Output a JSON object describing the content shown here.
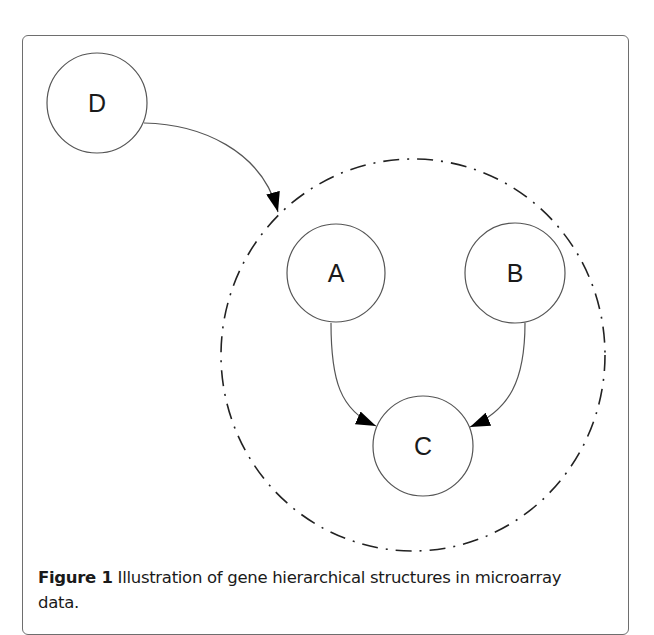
{
  "figure": {
    "number_label": "Figure 1",
    "caption_text": " Illustration of gene hierarchical structures in microarray data."
  },
  "diagram": {
    "nodes": [
      {
        "id": "D",
        "label": "D",
        "cx": 97,
        "cy": 103,
        "r": 50
      },
      {
        "id": "A",
        "label": "A",
        "cx": 336,
        "cy": 273,
        "r": 49
      },
      {
        "id": "B",
        "label": "B",
        "cx": 515,
        "cy": 273,
        "r": 50
      },
      {
        "id": "C",
        "label": "C",
        "cx": 423,
        "cy": 446,
        "r": 50
      }
    ],
    "group": {
      "label": "",
      "cx": 413,
      "cy": 355,
      "rx": 192,
      "ry": 196,
      "style": "dash-dot"
    },
    "edges": [
      {
        "from": "D",
        "to": "group"
      },
      {
        "from": "A",
        "to": "C"
      },
      {
        "from": "B",
        "to": "C"
      }
    ],
    "colors": {
      "stroke": "#555555",
      "arrow": "#000000",
      "text": "#1a1a1a"
    }
  }
}
